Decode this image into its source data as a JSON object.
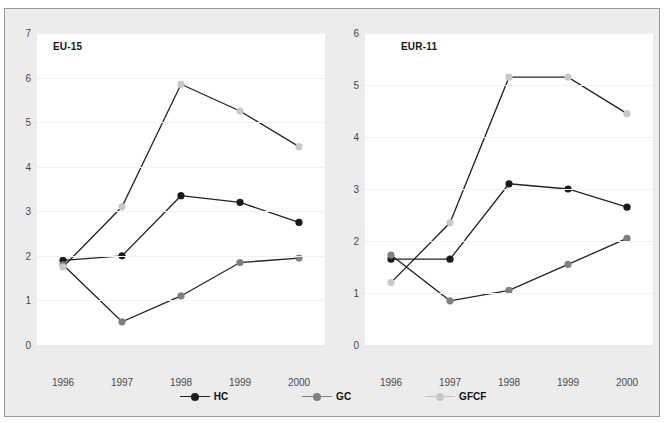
{
  "figure": {
    "caption_partial": "",
    "background": "#ececec",
    "panel_background": "#ffffff",
    "border_color": "#9a9a9a"
  },
  "legend": {
    "position": "bottom-center",
    "items": [
      {
        "label": "HC",
        "color": "#1a1a1a",
        "icon": "line-marker-icon"
      },
      {
        "label": "GC",
        "color": "#808080",
        "icon": "line-marker-icon"
      },
      {
        "label": "GFCF",
        "color": "#c8c8c8",
        "icon": "line-marker-icon"
      }
    ]
  },
  "chart_data": [
    {
      "type": "line",
      "title": "EU-15",
      "xlabel": "",
      "ylabel": "",
      "x": [
        "1996",
        "1997",
        "1998",
        "1999",
        "2000"
      ],
      "categories": [
        "1996",
        "1997",
        "1998",
        "1999",
        "2000"
      ],
      "ylim": [
        0,
        7
      ],
      "yticks": [
        0,
        1,
        2,
        3,
        4,
        5,
        6,
        7
      ],
      "grid": true,
      "legend_position": "bottom-center",
      "series": [
        {
          "name": "HC",
          "color": "#1a1a1a",
          "values": [
            1.9,
            2.0,
            3.35,
            3.2,
            2.75
          ]
        },
        {
          "name": "GC",
          "color": "#808080",
          "values": [
            1.8,
            0.52,
            1.1,
            1.85,
            1.95
          ]
        },
        {
          "name": "GFCF",
          "color": "#c8c8c8",
          "values": [
            1.75,
            3.1,
            5.85,
            5.25,
            4.45
          ]
        }
      ]
    },
    {
      "type": "line",
      "title": "EUR-11",
      "xlabel": "",
      "ylabel": "",
      "x": [
        "1996",
        "1997",
        "1998",
        "1999",
        "2000"
      ],
      "categories": [
        "1996",
        "1997",
        "1998",
        "1999",
        "2000"
      ],
      "ylim": [
        0,
        6
      ],
      "yticks": [
        0,
        1,
        2,
        3,
        4,
        5,
        6
      ],
      "grid": true,
      "legend_position": "bottom-center",
      "series": [
        {
          "name": "HC",
          "color": "#1a1a1a",
          "values": [
            1.65,
            1.65,
            3.1,
            3.0,
            2.65
          ]
        },
        {
          "name": "GC",
          "color": "#808080",
          "values": [
            1.73,
            0.85,
            1.05,
            1.55,
            2.05
          ]
        },
        {
          "name": "GFCF",
          "color": "#c8c8c8",
          "values": [
            1.2,
            2.35,
            5.15,
            5.15,
            4.45
          ]
        }
      ]
    }
  ]
}
